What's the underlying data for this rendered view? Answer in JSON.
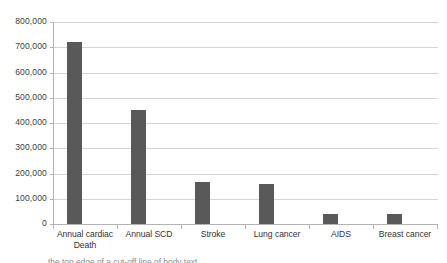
{
  "chart_data": {
    "type": "bar",
    "title": "",
    "subtitle": "",
    "xlabel": "",
    "ylabel": "",
    "categories": [
      "Annual cardiac Death",
      "Annual SCD",
      "Stroke",
      "Lung cancer",
      "AIDS",
      "Breast cancer"
    ],
    "values": [
      720000,
      450000,
      168000,
      160000,
      40000,
      40000
    ],
    "series": [
      {
        "name": "Annual deaths",
        "values": [
          720000,
          450000,
          168000,
          160000,
          40000,
          40000
        ]
      }
    ],
    "ylim": [
      0,
      800000
    ],
    "ytick_step": 100000,
    "ytick_labels": [
      "800,000",
      "700,000",
      "600,000",
      "500,000",
      "400,000",
      "300,000",
      "200,000",
      "100,000",
      "0"
    ],
    "ytick_values": [
      800000,
      700000,
      600000,
      500000,
      400000,
      300000,
      200000,
      100000,
      0
    ],
    "grid": true,
    "grid_axis": "y",
    "legend": false,
    "legend_position": "none",
    "bar_color": "#595959",
    "gridline_color": "#d4d4d4",
    "axis_color": "#b3b3b3",
    "plot_background": "#ffffff"
  },
  "caption": {
    "fragment": "the top edge of a cut-off line of body text"
  }
}
